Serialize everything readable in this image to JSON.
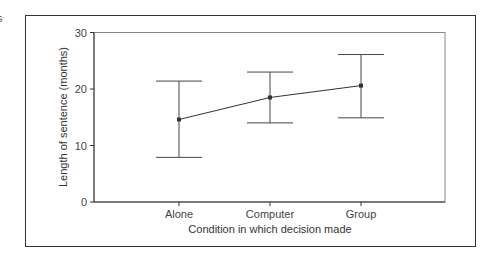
{
  "fragment_text": "s",
  "chart_data": {
    "type": "line",
    "subtype": "mean with error bars",
    "title": "",
    "xlabel": "Condition in which decision made",
    "ylabel": "Length of sentence (months)",
    "categories": [
      "Alone",
      "Computer",
      "Group"
    ],
    "series": [
      {
        "name": "Mean sentence length",
        "values": [
          14.6,
          18.5,
          20.6
        ],
        "error_upper": [
          21.4,
          23.0,
          26.1
        ],
        "error_lower": [
          7.9,
          14.0,
          14.9
        ]
      }
    ],
    "ylim": [
      0,
      30
    ],
    "yticks": [
      0,
      10,
      20,
      30
    ],
    "grid": false,
    "legend": "none"
  },
  "axis": {
    "yticks": [
      "0",
      "10",
      "20",
      "30"
    ],
    "xticks": [
      "Alone",
      "Computer",
      "Group"
    ],
    "xlabel": "Condition in which decision made",
    "ylabel": "Length of sentence (months)"
  },
  "colors": {
    "line": "#333333",
    "text": "#444444",
    "frame": "#333333"
  }
}
